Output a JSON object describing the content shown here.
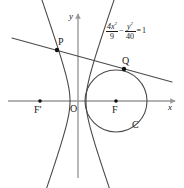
{
  "figure": {
    "type": "geometry-diagram",
    "background_color": "#ffffff",
    "stroke_color": "#4a4a4a",
    "axis_color": "#9a9a9a",
    "text_color": "#1a1a1a"
  },
  "axes": {
    "x_label": "x",
    "y_label": "y",
    "origin_label": "O",
    "x_axis": {
      "from_x": 8,
      "to_x": 175,
      "y": 101
    },
    "y_axis": {
      "x": 78,
      "from_y": 178,
      "to_y": 14
    }
  },
  "equation": {
    "term1_numerator": "4x",
    "term1_numerator_exponent": "2",
    "term1_denominator": "9",
    "operator": "−",
    "term2_numerator": "y",
    "term2_numerator_exponent": "2",
    "term2_denominator": "40",
    "equals": "=",
    "right_hand_side": "1",
    "plain_text": "4x²/9 − y²/40 = 1"
  },
  "points": [
    {
      "name": "F-prime",
      "label": "F′",
      "x": 40,
      "y": 101,
      "label_x": 34,
      "label_y": 105,
      "dot": true,
      "dot_r": 1.8
    },
    {
      "name": "origin",
      "label": "O",
      "x": 78,
      "y": 101,
      "label_x": 70,
      "label_y": 104,
      "dot": false,
      "dot_r": 0
    },
    {
      "name": "F",
      "label": "F",
      "x": 116,
      "y": 101,
      "label_x": 112,
      "label_y": 105,
      "dot": true,
      "dot_r": 1.8
    },
    {
      "name": "P",
      "label": "P",
      "x": 57,
      "y": 50,
      "label_x": 58,
      "label_y": 37,
      "dot": true,
      "dot_r": 2.2
    },
    {
      "name": "Q",
      "label": "Q",
      "x": 124,
      "y": 69,
      "label_x": 122,
      "label_y": 56,
      "dot": true,
      "dot_r": 2.2
    }
  ],
  "circle": {
    "label": "C",
    "center_x": 116,
    "center_y": 101,
    "radius": 31,
    "label_x": 132,
    "label_y": 120
  },
  "hyperbola": {
    "left_vertex_x": 70,
    "right_vertex_x": 88,
    "center_x": 78,
    "center_y": 101,
    "a": 8,
    "b": 23,
    "opens": "horizontal"
  },
  "secant_line": {
    "name": "line-through-P-and-Q",
    "x1": 12,
    "y1": 38,
    "x2": 172,
    "y2": 82
  }
}
